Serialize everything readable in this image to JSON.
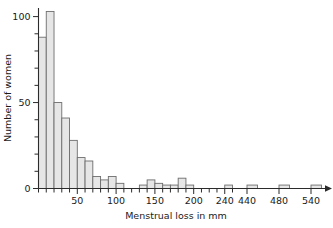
{
  "chart_data": {
    "type": "bar",
    "title": "",
    "subtitle": "",
    "xlabel": "Menstrual loss in mm",
    "ylabel": "Number of women",
    "grid": false,
    "legend": null,
    "bin_width": 10,
    "xlim": [
      0,
      250
    ],
    "ylim": [
      0,
      105
    ],
    "x_tick_labels": [
      "50",
      "100",
      "150",
      "200",
      "240",
      "440",
      "480",
      "540"
    ],
    "x_tick_values": [
      50,
      100,
      150,
      200,
      240,
      440,
      480,
      540
    ],
    "x_minor_tick_step": 10,
    "y_tick_labels": [
      "0",
      "50",
      "100"
    ],
    "y_tick_values": [
      0,
      50,
      100
    ],
    "y_minor_tick_step": 10,
    "axis_break": true,
    "axis_break_note": "x-axis compressed after 200; 240, 440, 480, 540 shown as isolated bins",
    "bin_starts": [
      0,
      10,
      20,
      30,
      40,
      50,
      60,
      70,
      80,
      90,
      100,
      110,
      120,
      130,
      140,
      150,
      160,
      170,
      180,
      190,
      200,
      240,
      440,
      480,
      540
    ],
    "categories": [
      "0-10",
      "10-20",
      "20-30",
      "30-40",
      "40-50",
      "50-60",
      "60-70",
      "70-80",
      "80-90",
      "90-100",
      "100-110",
      "110-120",
      "120-130",
      "130-140",
      "140-150",
      "150-160",
      "160-170",
      "170-180",
      "180-190",
      "190-200",
      "200-210",
      "240-250",
      "440-450",
      "480-490",
      "540-550"
    ],
    "values": [
      88,
      103,
      50,
      41,
      28,
      18,
      16,
      7,
      5,
      7,
      3,
      0,
      0,
      2,
      5,
      3,
      2,
      2,
      6,
      2,
      0,
      2,
      2,
      2,
      2
    ],
    "bar_fill_color": "#e6e6e6",
    "bar_edge_color": "#6d6d6d",
    "axis_color": "#2b2b2b"
  }
}
